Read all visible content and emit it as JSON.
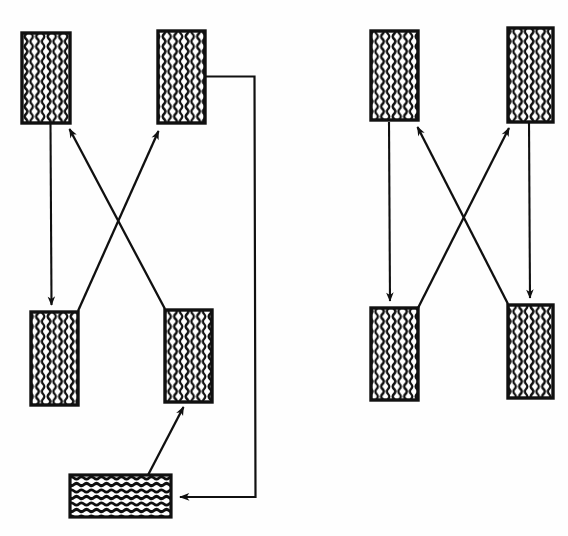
{
  "figure": {
    "background_color": "#fefefe",
    "ink_color": "#101010",
    "caption": ""
  },
  "chart_data": {
    "type": "diagram",
    "groups": [
      {
        "id": "left-group",
        "name": "left schematic group",
        "nodes": [
          {
            "id": "L-TL",
            "label": "",
            "role": "upper-left block",
            "hatch": "vertical-wavy",
            "x": 22,
            "y": 33,
            "w": 48,
            "h": 90
          },
          {
            "id": "L-TR",
            "label": "",
            "role": "upper-right block",
            "hatch": "vertical-wavy",
            "x": 158,
            "y": 31,
            "w": 47,
            "h": 92
          },
          {
            "id": "L-BL",
            "label": "",
            "role": "lower-left block",
            "hatch": "vertical-wavy",
            "x": 31,
            "y": 312,
            "w": 47,
            "h": 93
          },
          {
            "id": "L-BR",
            "label": "",
            "role": "lower-right block",
            "hatch": "vertical-wavy",
            "x": 165,
            "y": 310,
            "w": 47,
            "h": 92
          },
          {
            "id": "L-BOT",
            "label": "",
            "role": "bottom horizontal block",
            "hatch": "horizontal-wavy",
            "x": 70,
            "y": 475,
            "w": 101,
            "h": 42
          }
        ],
        "edges": [
          {
            "from": "L-TL",
            "to": "L-BL",
            "style": "straight",
            "arrow": "end",
            "direction": "down"
          },
          {
            "from": "L-BL",
            "to": "L-TR",
            "style": "straight",
            "arrow": "end",
            "direction": "up-right"
          },
          {
            "from": "L-BR",
            "to": "L-TL",
            "style": "straight",
            "arrow": "end",
            "direction": "up-left"
          },
          {
            "from": "L-BOT",
            "to": "L-BR",
            "style": "straight",
            "arrow": "end",
            "direction": "up-right"
          },
          {
            "from": "L-TR",
            "to": "L-BOT",
            "style": "orthogonal-routed",
            "arrow": "end",
            "direction": "right-down-left"
          }
        ]
      },
      {
        "id": "right-group",
        "name": "right schematic group",
        "nodes": [
          {
            "id": "R-TL",
            "label": "",
            "role": "upper-left block",
            "hatch": "vertical-wavy",
            "x": 371,
            "y": 31,
            "w": 47,
            "h": 89
          },
          {
            "id": "R-TR",
            "label": "",
            "role": "upper-right block",
            "hatch": "vertical-wavy",
            "x": 508,
            "y": 28,
            "w": 45,
            "h": 94
          },
          {
            "id": "R-BL",
            "label": "",
            "role": "lower-left block",
            "hatch": "vertical-wavy",
            "x": 371,
            "y": 308,
            "w": 47,
            "h": 92
          },
          {
            "id": "R-BR",
            "label": "",
            "role": "lower-right block",
            "hatch": "vertical-wavy",
            "x": 508,
            "y": 305,
            "w": 45,
            "h": 93
          }
        ],
        "edges": [
          {
            "from": "R-TL",
            "to": "R-BL",
            "style": "straight",
            "arrow": "end",
            "direction": "down"
          },
          {
            "from": "R-BL",
            "to": "R-TR",
            "style": "straight",
            "arrow": "end",
            "direction": "up-right"
          },
          {
            "from": "R-BR",
            "to": "R-TL",
            "style": "straight",
            "arrow": "end",
            "direction": "up-left"
          },
          {
            "from": "R-TR",
            "to": "R-BR",
            "style": "straight",
            "arrow": "end",
            "direction": "down"
          }
        ]
      }
    ],
    "legend": [],
    "grid": false
  }
}
